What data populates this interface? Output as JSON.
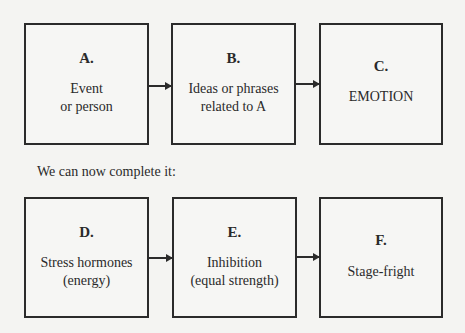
{
  "diagram": {
    "top_row": [
      {
        "letter": "A.",
        "lines": [
          "Event",
          "or person"
        ]
      },
      {
        "letter": "B.",
        "lines": [
          "Ideas or phrases",
          "related to A"
        ]
      },
      {
        "letter": "C.",
        "lines": [
          "EMOTION"
        ]
      }
    ],
    "caption": "We can now complete it:",
    "bottom_row": [
      {
        "letter": "D.",
        "lines": [
          "Stress hormones",
          "(energy)"
        ]
      },
      {
        "letter": "E.",
        "lines": [
          "Inhibition",
          "(equal strength)"
        ]
      },
      {
        "letter": "F.",
        "lines": [
          "Stage-fright"
        ]
      }
    ],
    "edges": [
      {
        "from": "A",
        "to": "B"
      },
      {
        "from": "B",
        "to": "C"
      },
      {
        "from": "D",
        "to": "E"
      },
      {
        "from": "E",
        "to": "F"
      }
    ]
  }
}
